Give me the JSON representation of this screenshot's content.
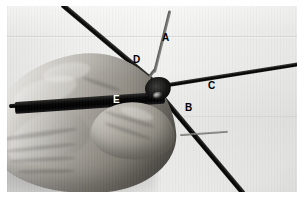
{
  "image": {
    "kind": "photograph",
    "subject": "gloved hand holding bundled wires converging at a junction",
    "color_mode": "grayscale",
    "border_color": "#ffffff",
    "background_color": "#ededeb"
  },
  "labels": [
    {
      "id": "A",
      "text": "A",
      "color": "#000000",
      "refers_to": "thin upper wire"
    },
    {
      "id": "B",
      "text": "B",
      "color": "#000000",
      "refers_to": "lower-right wire"
    },
    {
      "id": "C",
      "text": "C",
      "color": "#000000",
      "refers_to": "right horizontal wire"
    },
    {
      "id": "D",
      "text": "D",
      "color": "#000000",
      "refers_to": "upper-left diagonal wire"
    },
    {
      "id": "E",
      "text": "E",
      "color": "#ffffff",
      "refers_to": "dark cable held in hand"
    }
  ],
  "elements": {
    "hand_label": "gloved hand",
    "junction_label": "wire junction",
    "wire_a_label": "wire A",
    "wire_b_label": "wire B",
    "wire_c_label": "wire C",
    "wire_d_label": "wire D",
    "wire_e_label": "cable E",
    "stub_label": "thin wire stub"
  }
}
